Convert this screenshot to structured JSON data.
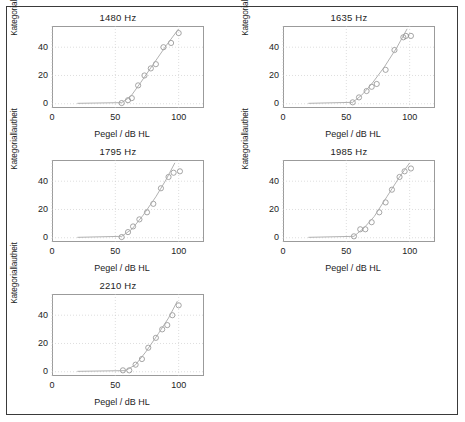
{
  "figure": {
    "border_color": "#3a3a3a",
    "background": "#ffffff",
    "axis_color": "#9b9b9b",
    "grid_color": "#c8c8c8",
    "marker_color": "#8f8f8f",
    "curve_color": "#a8a8a8",
    "text_color": "#1d1d1d"
  },
  "chart_data": [
    {
      "type": "scatter",
      "title": "1480 Hz",
      "xlabel": "Pegel / dB HL",
      "ylabel": "Kategoriallautheit",
      "xlim": [
        0,
        120
      ],
      "ylim": [
        -3,
        55
      ],
      "xticks": [
        0,
        50,
        100
      ],
      "yticks": [
        0,
        20,
        40
      ],
      "xtick_labels": [
        "0",
        "50",
        "100"
      ],
      "ytick_labels": [
        "0",
        "20",
        "40"
      ],
      "grid": true,
      "legend": "none",
      "series": [
        {
          "name": "measured",
          "marker": "open-circle",
          "x": [
            55,
            60,
            63,
            68,
            73,
            78,
            82,
            88,
            94,
            100
          ],
          "y": [
            0.5,
            2.5,
            4.0,
            13.0,
            20.0,
            25.0,
            28.0,
            40.0,
            43.0,
            50.0
          ]
        },
        {
          "name": "fit",
          "marker": "line",
          "x": [
            20,
            55,
            62,
            70,
            80,
            90,
            100
          ],
          "y": [
            0.3,
            0.8,
            5.0,
            15.0,
            28.0,
            41.0,
            53.0
          ]
        }
      ]
    },
    {
      "type": "scatter",
      "title": "1635 Hz",
      "xlabel": "Pegel / dB HL",
      "ylabel": "Kategoriallautheit",
      "xlim": [
        0,
        120
      ],
      "ylim": [
        -3,
        55
      ],
      "xticks": [
        0,
        50,
        100
      ],
      "yticks": [
        0,
        20,
        40
      ],
      "xtick_labels": [
        "0",
        "50",
        "100"
      ],
      "ytick_labels": [
        "0",
        "20",
        "40"
      ],
      "grid": true,
      "legend": "none",
      "series": [
        {
          "name": "measured",
          "marker": "open-circle",
          "x": [
            55,
            60,
            66,
            70,
            74,
            81,
            88,
            95,
            97,
            101
          ],
          "y": [
            1.0,
            4.5,
            9.0,
            12.0,
            14.0,
            24.0,
            38.0,
            47.0,
            48.0,
            48.0
          ]
        },
        {
          "name": "fit",
          "marker": "line",
          "x": [
            20,
            55,
            62,
            70,
            80,
            90,
            98
          ],
          "y": [
            0.3,
            1.0,
            6.0,
            14.0,
            26.0,
            40.0,
            53.0
          ]
        }
      ]
    },
    {
      "type": "scatter",
      "title": "1795 Hz",
      "xlabel": "Pegel / dB HL",
      "ylabel": "Kategoriallautheit",
      "xlim": [
        0,
        120
      ],
      "ylim": [
        -3,
        55
      ],
      "xticks": [
        0,
        50,
        100
      ],
      "yticks": [
        0,
        20,
        40
      ],
      "xtick_labels": [
        "0",
        "50",
        "100"
      ],
      "ytick_labels": [
        "0",
        "20",
        "40"
      ],
      "grid": true,
      "legend": "none",
      "series": [
        {
          "name": "measured",
          "marker": "open-circle",
          "x": [
            55,
            60,
            64,
            69,
            75,
            80,
            86,
            92,
            96,
            101
          ],
          "y": [
            0.5,
            4.0,
            8.0,
            13.0,
            18.0,
            24.0,
            35.0,
            43.0,
            46.0,
            47.0
          ]
        },
        {
          "name": "fit",
          "marker": "line",
          "x": [
            20,
            55,
            63,
            72,
            82,
            90,
            97
          ],
          "y": [
            0.3,
            1.0,
            6.0,
            16.0,
            29.0,
            41.0,
            53.0
          ]
        }
      ]
    },
    {
      "type": "scatter",
      "title": "1985 Hz",
      "xlabel": "Pegel / dB HL",
      "ylabel": "Kategoriallautheit",
      "xlim": [
        0,
        120
      ],
      "ylim": [
        -3,
        55
      ],
      "xticks": [
        0,
        50,
        100
      ],
      "yticks": [
        0,
        20,
        40
      ],
      "xtick_labels": [
        "0",
        "50",
        "100"
      ],
      "ytick_labels": [
        "0",
        "20",
        "40"
      ],
      "grid": true,
      "legend": "none",
      "series": [
        {
          "name": "measured",
          "marker": "open-circle",
          "x": [
            56,
            61,
            65,
            70,
            76,
            81,
            86,
            92,
            96,
            101
          ],
          "y": [
            1.0,
            6.0,
            6.0,
            11.0,
            18.0,
            25.0,
            34.0,
            43.0,
            47.0,
            49.0
          ]
        },
        {
          "name": "fit",
          "marker": "line",
          "x": [
            20,
            56,
            64,
            72,
            82,
            92,
            100
          ],
          "y": [
            0.3,
            1.0,
            7.0,
            15.0,
            29.0,
            43.0,
            53.0
          ]
        }
      ]
    },
    {
      "type": "scatter",
      "title": "2210 Hz",
      "xlabel": "Pegel / dB HL",
      "ylabel": "Kategoriallautheit",
      "xlim": [
        0,
        120
      ],
      "ylim": [
        -3,
        55
      ],
      "xticks": [
        0,
        50,
        100
      ],
      "yticks": [
        0,
        20,
        40
      ],
      "xtick_labels": [
        "0",
        "50",
        "100"
      ],
      "ytick_labels": [
        "0",
        "20",
        "40"
      ],
      "grid": true,
      "legend": "none",
      "series": [
        {
          "name": "measured",
          "marker": "open-circle",
          "x": [
            56,
            61,
            66,
            71,
            76,
            82,
            87,
            91,
            95,
            100
          ],
          "y": [
            1.0,
            1.0,
            5.0,
            9.0,
            17.0,
            24.0,
            30.0,
            33.0,
            40.0,
            47.0
          ]
        },
        {
          "name": "fit",
          "marker": "line",
          "x": [
            20,
            58,
            66,
            74,
            84,
            92,
            99
          ],
          "y": [
            0.3,
            0.8,
            5.0,
            14.0,
            27.0,
            38.0,
            50.0
          ]
        }
      ]
    }
  ]
}
